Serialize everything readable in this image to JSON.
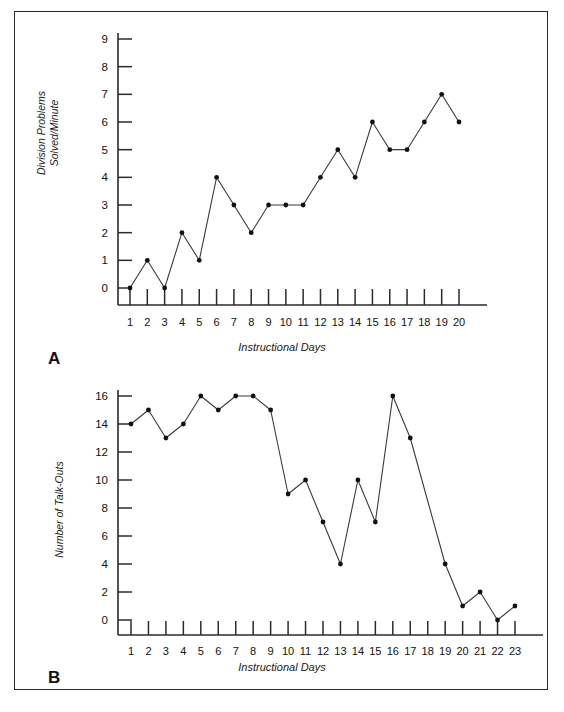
{
  "figure": {
    "panels": [
      "A",
      "B"
    ],
    "border_color": "#2b2b2b",
    "background": "#ffffff",
    "line_color": "#3a3a3a",
    "marker_color": "#111111"
  },
  "panel_a": {
    "label": "A",
    "ylabel_line1": "Division Problems",
    "ylabel_line2": "Solved/Minute",
    "xlabel": "Instructional Days"
  },
  "panel_b": {
    "label": "B",
    "ylabel": "Number of Talk-Outs",
    "xlabel": "Instructional Days"
  },
  "chart_data": [
    {
      "type": "line",
      "panel": "A",
      "title": "",
      "xlabel": "Instructional Days",
      "ylabel": "Division Problems Solved/Minute",
      "x": [
        1,
        2,
        3,
        4,
        5,
        6,
        7,
        8,
        9,
        10,
        11,
        12,
        13,
        14,
        15,
        16,
        17,
        18,
        19,
        20
      ],
      "values": [
        0,
        1,
        0,
        2,
        1,
        4,
        3,
        2,
        3,
        3,
        3,
        4,
        5,
        4,
        6,
        5,
        5,
        6,
        7,
        6
      ],
      "xticklabels": [
        "1",
        "2",
        "3",
        "4",
        "5",
        "6",
        "7",
        "8",
        "9",
        "10",
        "11",
        "12",
        "13",
        "14",
        "15",
        "16",
        "17",
        "18",
        "19",
        "20"
      ],
      "yticks": [
        0,
        1,
        2,
        3,
        4,
        5,
        6,
        7,
        8,
        9
      ],
      "yticklabels": [
        "0",
        "1",
        "2",
        "3",
        "4",
        "5",
        "6",
        "7",
        "8",
        "9"
      ],
      "ylim": [
        0,
        9
      ],
      "xlim": [
        1,
        20
      ],
      "grid": false,
      "legend": "none",
      "markers": true
    },
    {
      "type": "line",
      "panel": "B",
      "title": "",
      "xlabel": "Instructional Days",
      "ylabel": "Number of Talk-Outs",
      "x": [
        1,
        2,
        3,
        4,
        5,
        6,
        7,
        8,
        9,
        10,
        11,
        12,
        13,
        14,
        15,
        16,
        17,
        18,
        19,
        20,
        21,
        22,
        23
      ],
      "values": [
        14,
        15,
        13,
        14,
        16,
        15,
        16,
        16,
        15,
        9,
        10,
        7,
        4,
        10,
        7,
        16,
        13,
        8.5,
        4,
        1,
        2,
        0,
        1
      ],
      "hidden_markers": [
        18
      ],
      "xticklabels": [
        "1",
        "2",
        "3",
        "4",
        "5",
        "6",
        "7",
        "8",
        "9",
        "10",
        "11",
        "12",
        "13",
        "14",
        "15",
        "16",
        "17",
        "18",
        "19",
        "20",
        "21",
        "22",
        "23"
      ],
      "yticks": [
        0,
        2,
        4,
        6,
        8,
        10,
        12,
        14,
        16
      ],
      "yticklabels": [
        "0",
        "2",
        "4",
        "6",
        "8",
        "10",
        "12",
        "14",
        "16"
      ],
      "ylim": [
        0,
        16
      ],
      "xlim": [
        1,
        23
      ],
      "grid": false,
      "legend": "none",
      "markers": true
    }
  ]
}
